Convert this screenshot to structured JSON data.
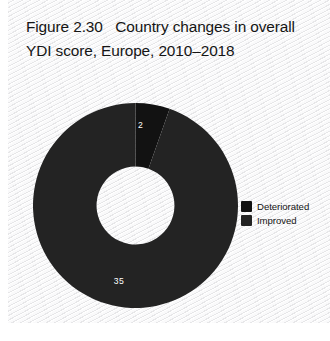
{
  "figure": {
    "title": "Figure 2.30   Country changes in overall YDI score, Europe, 2010–2018"
  },
  "legend": {
    "items": [
      {
        "label": "Deteriorated",
        "color": "#121212",
        "swatch_icon": "square-swatch-icon"
      },
      {
        "label": "Improved",
        "color": "#232323",
        "swatch_icon": "square-swatch-icon"
      }
    ]
  },
  "chart_data": {
    "type": "pie",
    "variant": "donut",
    "title": "Figure 2.30   Country changes in overall YDI score, Europe, 2010–2018",
    "xlabel": "",
    "ylabel": "",
    "categories": [
      "Deteriorated",
      "Improved"
    ],
    "values": [
      2,
      35
    ],
    "labels": [
      "2",
      "35"
    ],
    "colors": [
      "#121212",
      "#232323"
    ],
    "total": 37,
    "start_angle_deg": 0,
    "direction": "clockwise",
    "hole_ratio": 0.38,
    "grid": false,
    "legend_position": "right",
    "slices": [
      {
        "name": "Deteriorated",
        "value": 2,
        "label": "2",
        "color": "#121212",
        "percent": 5.4,
        "start_angle_deg": 0,
        "end_angle_deg": 19.46,
        "label_x": 107.5,
        "label_y": 23
      },
      {
        "name": "Improved",
        "value": 35,
        "label": "35",
        "color": "#232323",
        "percent": 94.6,
        "start_angle_deg": 19.46,
        "end_angle_deg": 360,
        "label_x": 86,
        "label_y": 179
      }
    ]
  }
}
